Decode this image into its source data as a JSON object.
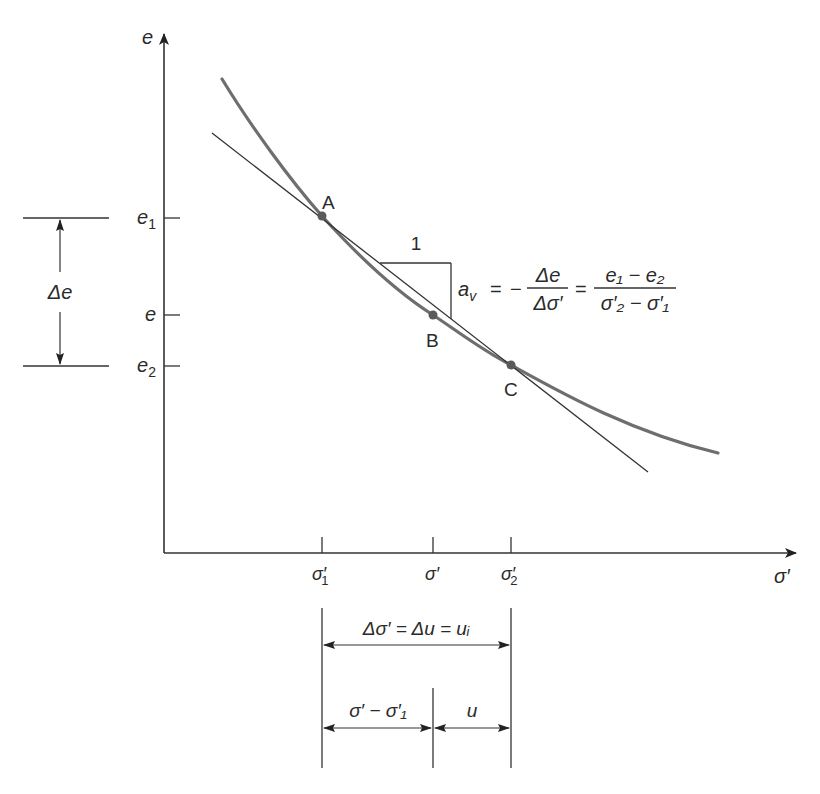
{
  "diagram": {
    "type": "consolidation e-sigma' curve",
    "axes": {
      "y_label": "e",
      "x_label": "σ′"
    },
    "y_ticks": [
      {
        "id": "e1",
        "base": "e",
        "sub": "1"
      },
      {
        "id": "e",
        "base": "e",
        "sub": ""
      },
      {
        "id": "e2",
        "base": "e",
        "sub": "2"
      }
    ],
    "x_ticks": [
      {
        "id": "sigma1",
        "base": "σ′",
        "sub": "1"
      },
      {
        "id": "sigma",
        "base": "σ′",
        "sub": ""
      },
      {
        "id": "sigma2",
        "base": "σ′",
        "sub": "2"
      }
    ],
    "points": [
      {
        "label": "A"
      },
      {
        "label": "B"
      },
      {
        "label": "C"
      }
    ],
    "slope_triangle": {
      "run_label": "1"
    },
    "formula": {
      "lhs_base": "a",
      "lhs_sub": "v",
      "eq1": "=",
      "minus": "−",
      "frac1_num": "Δe",
      "frac1_den": "Δσ′",
      "eq2": "=",
      "frac2_num": "e₁ − e₂",
      "frac2_den": "σ′₂ − σ′₁"
    },
    "delta_e_label": "Δe",
    "dimensions": {
      "total": "Δσ′ = Δu = uᵢ",
      "left": "σ′ − σ′₁",
      "right": "u"
    },
    "colors": {
      "curve": "#6e6e6e",
      "line": "#333333",
      "point": "#5a5a5a",
      "text": "#2a2a2a"
    }
  }
}
